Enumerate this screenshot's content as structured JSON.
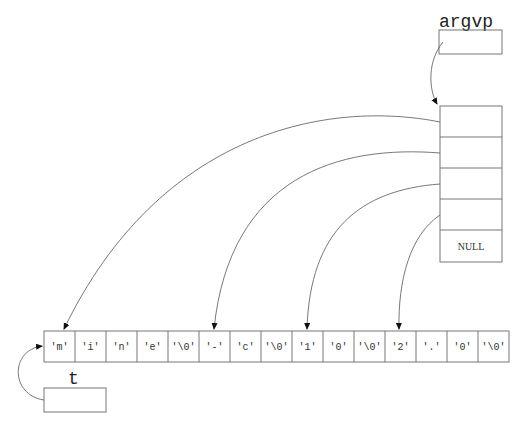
{
  "diagram": {
    "argvp": {
      "label": "argvp"
    },
    "argv_array": {
      "slots": [
        "",
        "",
        "",
        "",
        "NULL"
      ]
    },
    "string_buffer": {
      "cells": [
        "'m'",
        "'i'",
        "'n'",
        "'e'",
        "'\\0'",
        "'-'",
        "'c'",
        "'\\0'",
        "'1'",
        "'0'",
        "'\\0'",
        "'2'",
        "'.'",
        "'0'",
        "'\\0'"
      ]
    },
    "t": {
      "label": "t"
    },
    "pointers": [
      {
        "from": "argvp",
        "to": "argv_array[0]"
      },
      {
        "from": "argv_array[0]",
        "to": "string_buffer[0]"
      },
      {
        "from": "argv_array[1]",
        "to": "string_buffer[5]"
      },
      {
        "from": "argv_array[2]",
        "to": "string_buffer[8]"
      },
      {
        "from": "argv_array[3]",
        "to": "string_buffer[11]"
      },
      {
        "from": "t",
        "to": "string_buffer[0]"
      }
    ],
    "colors": {
      "line": "#555555",
      "text": "#222222",
      "background": "#ffffff"
    }
  }
}
